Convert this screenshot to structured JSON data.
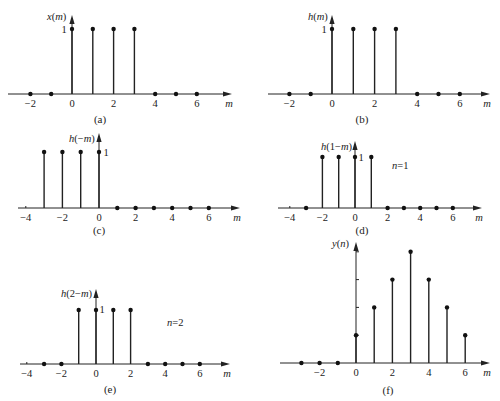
{
  "figure": {
    "axis_label_x": "m"
  },
  "chart_data": [
    {
      "id": "a",
      "type": "stem",
      "caption": "(a)",
      "ylabel": "x(m)",
      "xlabel": "m",
      "unit_label": "1",
      "unit_label_side": "left",
      "annotation": "",
      "x_ticks": [
        -2,
        0,
        2,
        4,
        6
      ],
      "x": [
        -2,
        -1,
        0,
        1,
        2,
        3,
        4,
        5,
        6
      ],
      "values": [
        0,
        0,
        1,
        1,
        1,
        1,
        0,
        0,
        0
      ],
      "layout": {
        "x0": 72,
        "dx": 20.8,
        "y_axis": 94,
        "unit_px": 65,
        "arrow_top": 15,
        "ax_left": 8,
        "ax_right": 232,
        "label_x": 47,
        "label_y": 20,
        "unit_x": 64,
        "unit_y": 33,
        "cap_x": 100,
        "cap_y": 123,
        "yaxis_x": 72
      }
    },
    {
      "id": "b",
      "type": "stem",
      "caption": "(b)",
      "ylabel": "h(m)",
      "xlabel": "m",
      "unit_label": "1",
      "unit_label_side": "left",
      "annotation": "",
      "x_ticks": [
        -2,
        0,
        2,
        4,
        6
      ],
      "x": [
        -2,
        -1,
        0,
        1,
        2,
        3,
        4,
        5,
        6
      ],
      "values": [
        0,
        0,
        1,
        1,
        1,
        1,
        0,
        0,
        0
      ],
      "layout": {
        "x0": 332,
        "dx": 21.3,
        "y_axis": 94,
        "unit_px": 65,
        "arrow_top": 15,
        "ax_left": 268,
        "ax_right": 490,
        "label_x": 308,
        "label_y": 20,
        "unit_x": 324,
        "unit_y": 33,
        "cap_x": 362,
        "cap_y": 123,
        "yaxis_x": 332
      }
    },
    {
      "id": "c",
      "type": "stem",
      "caption": "(c)",
      "ylabel": "h(−m)",
      "xlabel": "m",
      "unit_label": "1",
      "unit_label_side": "right",
      "annotation": "",
      "x_ticks": [
        -4,
        -2,
        0,
        2,
        4,
        6
      ],
      "x": [
        -3,
        -2,
        -1,
        0,
        1,
        2,
        3,
        4,
        5,
        6
      ],
      "values": [
        1,
        1,
        1,
        1,
        0,
        0,
        0,
        0,
        0,
        0
      ],
      "layout": {
        "x0": 99,
        "dx": 18.3,
        "y_axis": 208,
        "unit_px": 56,
        "arrow_top": 133,
        "ax_left": 18,
        "ax_right": 240,
        "label_x": 69,
        "label_y": 142,
        "unit_x": 106,
        "unit_y": 156,
        "cap_x": 99,
        "cap_y": 234,
        "yaxis_x": 99
      }
    },
    {
      "id": "d",
      "type": "stem",
      "caption": "(d)",
      "ylabel": "h(1−m)",
      "xlabel": "m",
      "unit_label": "1",
      "unit_label_side": "right",
      "annotation": "n=1",
      "x_ticks": [
        -4,
        -2,
        0,
        2,
        4,
        6
      ],
      "x": [
        -3,
        -2,
        -1,
        0,
        1,
        2,
        3,
        4,
        5,
        6
      ],
      "values": [
        0,
        1,
        1,
        1,
        1,
        0,
        0,
        0,
        0,
        0
      ],
      "layout": {
        "x0": 355,
        "dx": 16.3,
        "y_axis": 208,
        "unit_px": 51,
        "arrow_top": 141,
        "ax_left": 278,
        "ax_right": 482,
        "label_x": 321,
        "label_y": 150,
        "unit_x": 361,
        "unit_y": 161,
        "cap_x": 362,
        "cap_y": 234,
        "yaxis_x": 355,
        "ann_x": 392,
        "ann_y": 169
      }
    },
    {
      "id": "e",
      "type": "stem",
      "caption": "(e)",
      "ylabel": "h(2−m)",
      "xlabel": "m",
      "unit_label": "1",
      "unit_label_side": "right",
      "annotation": "n=2",
      "x_ticks": [
        -4,
        -2,
        0,
        2,
        4,
        6
      ],
      "x": [
        -3,
        -2,
        -1,
        0,
        1,
        2,
        3,
        4,
        5,
        6
      ],
      "values": [
        0,
        0,
        1,
        1,
        1,
        1,
        0,
        0,
        0,
        0
      ],
      "layout": {
        "x0": 96,
        "dx": 17.3,
        "y_axis": 364,
        "unit_px": 54,
        "arrow_top": 289,
        "ax_left": 20,
        "ax_right": 230,
        "label_x": 61,
        "label_y": 297,
        "unit_x": 102,
        "unit_y": 313,
        "cap_x": 110,
        "cap_y": 393,
        "yaxis_x": 96,
        "ann_x": 167,
        "ann_y": 326
      }
    },
    {
      "id": "f",
      "type": "stem",
      "caption": "(f)",
      "ylabel": "y(n)",
      "xlabel": "m",
      "unit_label": "",
      "unit_label_side": "none",
      "annotation": "",
      "x_ticks": [
        -2,
        0,
        2,
        4,
        6
      ],
      "x": [
        -3,
        -2,
        -1,
        0,
        1,
        2,
        3,
        4,
        5,
        6
      ],
      "values": [
        0,
        0,
        0,
        1,
        2,
        3,
        4,
        3,
        2,
        1
      ],
      "y_ticks": [
        1,
        2,
        3,
        4
      ],
      "layout": {
        "x0": 356,
        "dx": 18.2,
        "y_axis": 363,
        "unit_px": 27.8,
        "arrow_top": 242,
        "ax_left": 280,
        "ax_right": 490,
        "label_x": 332,
        "label_y": 247,
        "cap_x": 388,
        "cap_y": 394,
        "yaxis_x": 356
      }
    }
  ]
}
